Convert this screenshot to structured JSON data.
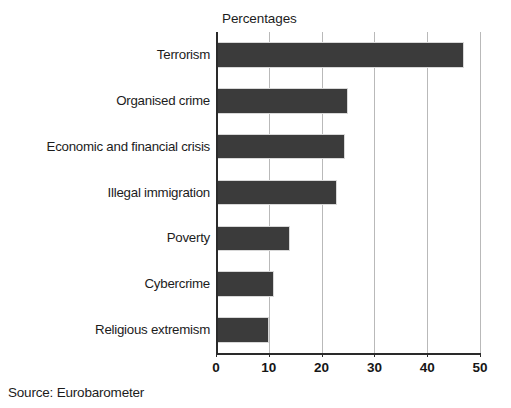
{
  "chart_data": {
    "type": "bar",
    "orientation": "horizontal",
    "title": "Percentages",
    "xlabel": "",
    "ylabel": "",
    "xlim": [
      0,
      50
    ],
    "xticks": [
      0,
      10,
      20,
      30,
      40,
      50
    ],
    "xtick_labels": [
      "0",
      "10",
      "20",
      "30",
      "40",
      "50"
    ],
    "grid": "vertical",
    "legend": "none",
    "categories": [
      "Terrorism",
      "Organised crime",
      "Economic and financial crisis",
      "Illegal immigration",
      "Poverty",
      "Cybercrime",
      "Religious extremism"
    ],
    "values": [
      47,
      25,
      24.5,
      23,
      14,
      11,
      10
    ],
    "series": [
      {
        "name": "Percentages",
        "values": [
          47,
          25,
          24.5,
          23,
          14,
          11,
          10
        ],
        "color": "#3b3b3b"
      }
    ],
    "bar_color": "#3b3b3b",
    "gridline_color": "#b9b9b9",
    "axis_color": "#2a2a2a",
    "background": "#ffffff"
  },
  "caption": {
    "source": "Source: Eurobarometer"
  }
}
